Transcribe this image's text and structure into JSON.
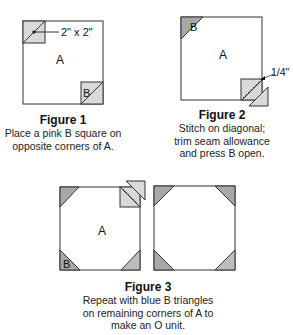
{
  "figures": [
    {
      "title": "Figure 1",
      "caption_lines": [
        "Place a pink B square on",
        "opposite corners of A."
      ],
      "labels": {
        "main": "A",
        "corner": "B",
        "dimension": "2\" x 2\""
      }
    },
    {
      "title": "Figure 2",
      "caption_lines": [
        "Stitch on diagonal;",
        "trim seam allowance",
        "and press B open."
      ],
      "labels": {
        "main": "A",
        "corner": "B",
        "seam": "1/4\""
      }
    },
    {
      "title": "Figure 3",
      "caption_lines": [
        "Repeat with blue B triangles",
        "on remaining corners of A to",
        "make an O unit."
      ],
      "labels": {
        "main": "A",
        "corner": "B"
      }
    }
  ],
  "colors": {
    "outline": "#333333",
    "pink_fill": "#d9d9d9",
    "blue_fill": "#a8a8a8",
    "background": "#ffffff"
  }
}
